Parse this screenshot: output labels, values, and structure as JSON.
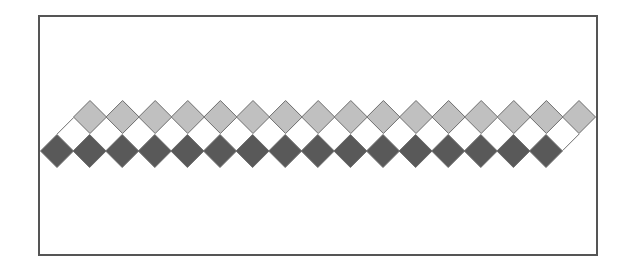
{
  "canvas": {
    "width": 627,
    "height": 271,
    "background": "#ffffff"
  },
  "frame": {
    "x": 38,
    "y": 15,
    "width": 560,
    "height": 241,
    "border_color": "#555555",
    "border_width": 2
  },
  "pattern": {
    "description": "Two-tone diamond border strip (sawtooth band)",
    "half_diagonal": 16.5,
    "spacing": 32.6,
    "stroke_color": "#6e6e6e",
    "stroke_width": 1,
    "rows": [
      {
        "name": "light-diamond-row",
        "fill": "#c0c0c0",
        "start_x": 90,
        "center_y": 117,
        "count": 16
      },
      {
        "name": "white-diamond-row",
        "fill": "#ffffff",
        "start_x": 73.7,
        "center_y": 134,
        "count": 16
      },
      {
        "name": "dark-diamond-row",
        "fill": "#595959",
        "start_x": 57,
        "center_y": 151,
        "count": 16
      }
    ]
  }
}
